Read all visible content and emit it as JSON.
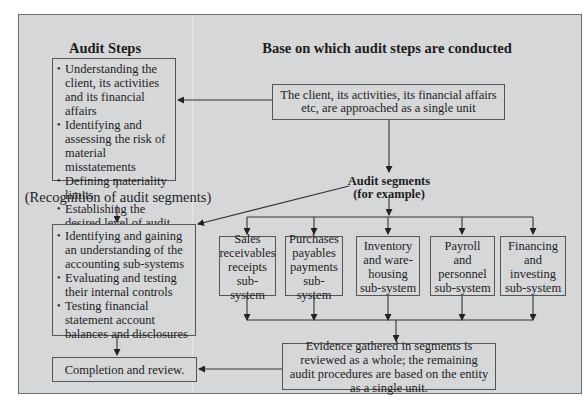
{
  "diagram": {
    "headings": {
      "left": "Audit Steps",
      "right": "Base on which audit steps are conducted"
    },
    "left_column": {
      "step1_items": [
        "Understanding the client, its activities and its financial affairs",
        "Identifying and assessing the risk of material misstatements",
        "Defining materiality limits",
        "Establishing the desired level of audit risk"
      ],
      "recognition_label": "(Recognition of audit segments)",
      "step2_items": [
        "Identifying and gaining an understanding of the accounting sub-systems",
        "Evaluating and testing their internal controls",
        "Testing financial statement account balances and disclosures"
      ],
      "completion": "Completion and review."
    },
    "right_column": {
      "single_unit_box": "The client, its activities, its financial affairs etc, are approached as a single unit",
      "segments_label_line1": "Audit segments",
      "segments_label_line2": "(for example)",
      "subsystems": [
        {
          "line1": "Sales",
          "line2": "receivables",
          "line3": "receipts",
          "line4": "sub-system"
        },
        {
          "line1": "Purchases",
          "line2": "payables",
          "line3": "payments",
          "line4": "sub-system"
        },
        {
          "line1": "Inventory",
          "line2": "and ware-",
          "line3": "housing",
          "line4": "sub-system"
        },
        {
          "line1": "Payroll",
          "line2": "and",
          "line3": "personnel",
          "line4": "sub-system"
        },
        {
          "line1": "Financing",
          "line2": "and",
          "line3": "investing",
          "line4": "sub-system"
        }
      ],
      "evidence_box": "Evidence gathered in segments is reviewed as a whole; the remaining audit procedures are based on the entity as a single unit."
    },
    "colors": {
      "background": "#d6d7d9",
      "border": "#555555",
      "text": "#1d1d1d"
    }
  }
}
